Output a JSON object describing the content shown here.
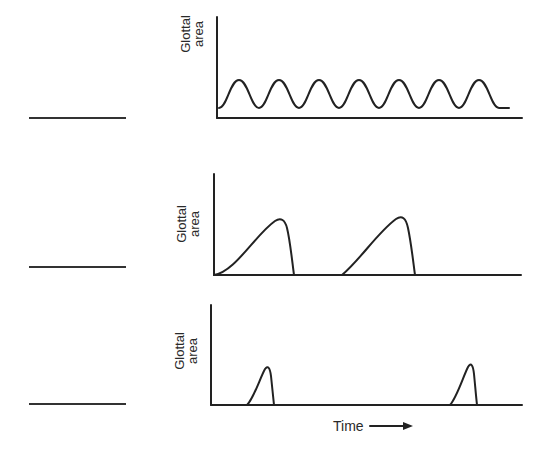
{
  "figure": {
    "panels": [
      {
        "id": "panel-1",
        "ylabel_line1": "Glottal",
        "ylabel_line2": "area",
        "waveform": "sinusoidal",
        "answer_blank": ""
      },
      {
        "id": "panel-2",
        "ylabel_line1": "Glottal",
        "ylabel_line2": "area",
        "waveform": "skewed pulses with closed phase",
        "answer_blank": ""
      },
      {
        "id": "panel-3",
        "ylabel_line1": "Glottal",
        "ylabel_line2": "area",
        "waveform": "brief pulses with long closed phase",
        "answer_blank": ""
      }
    ],
    "xlabel": "Time",
    "xlabel_arrow": "right-arrow",
    "stroke_color": "#222222"
  }
}
